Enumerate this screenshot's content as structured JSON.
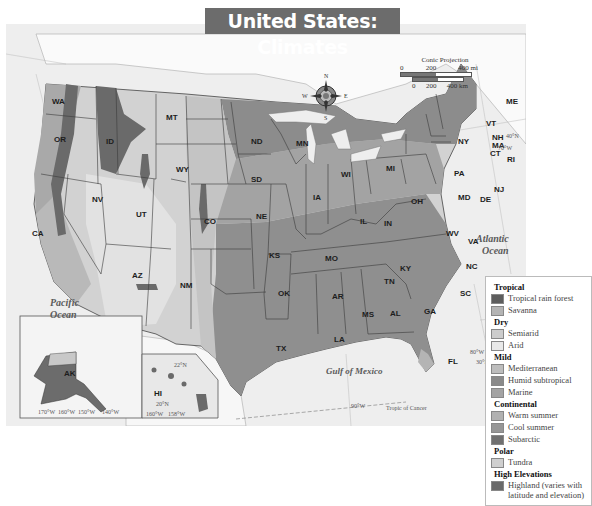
{
  "title": "United States: Climates",
  "projection": {
    "label": "Conic Projection",
    "scale_miles": [
      "0",
      "200",
      "400 mi"
    ],
    "scale_km": [
      "0",
      "200",
      "400 km"
    ]
  },
  "compass": {
    "n": "N",
    "s": "S",
    "e": "E",
    "w": "W"
  },
  "water_labels": {
    "pacific": [
      "Pacific",
      "Ocean"
    ],
    "atlantic": [
      "Atlantic",
      "Ocean"
    ],
    "gulf": "Gulf of Mexico",
    "tropic": "Tropic of Cancer"
  },
  "graticule": {
    "lat_40": "40°N",
    "lon_70": "70°W",
    "lon_80": "80°W",
    "lat_30": "30°N",
    "lon_90": "90°W",
    "ak": [
      "170°W",
      "160°W",
      "150°W",
      "140°W"
    ],
    "hi": [
      "160°W",
      "158°W"
    ],
    "hi_lat": [
      "22°N",
      "20°N"
    ]
  },
  "states": [
    "WA",
    "OR",
    "CA",
    "ID",
    "NV",
    "MT",
    "WY",
    "UT",
    "AZ",
    "CO",
    "NM",
    "ND",
    "SD",
    "NE",
    "KS",
    "OK",
    "TX",
    "MN",
    "IA",
    "MO",
    "AR",
    "LA",
    "WI",
    "IL",
    "MS",
    "MI",
    "IN",
    "KY",
    "TN",
    "AL",
    "OH",
    "WV",
    "GA",
    "FL",
    "SC",
    "NC",
    "VA",
    "PA",
    "NY",
    "MD",
    "DE",
    "NJ",
    "CT",
    "RI",
    "MA",
    "VT",
    "NH",
    "ME",
    "AK",
    "HI"
  ],
  "legend": {
    "groups": [
      {
        "heading": "Tropical",
        "items": [
          {
            "label": "Tropical rain forest",
            "color": "#5d5d5d"
          },
          {
            "label": "Savanna",
            "color": "#b4b4b4"
          }
        ]
      },
      {
        "heading": "Dry",
        "items": [
          {
            "label": "Semiarid",
            "color": "#cccccc"
          },
          {
            "label": "Arid",
            "color": "#e9e9e9"
          }
        ]
      },
      {
        "heading": "Mild",
        "items": [
          {
            "label": "Mediterranean",
            "color": "#bdbdbd"
          },
          {
            "label": "Humid subtropical",
            "color": "#8a8a8a"
          },
          {
            "label": "Marine",
            "color": "#a3a3a3"
          }
        ]
      },
      {
        "heading": "Continental",
        "items": [
          {
            "label": "Warm summer",
            "color": "#b1b1b1"
          },
          {
            "label": "Cool summer",
            "color": "#969696"
          },
          {
            "label": "Subarctic",
            "color": "#707070"
          }
        ]
      },
      {
        "heading": "Polar",
        "items": [
          {
            "label": "Tundra",
            "color": "#cfcfcf"
          }
        ]
      },
      {
        "heading": "High Elevations",
        "items": [
          {
            "label": "Highland (varies with latitude and elevation)",
            "color": "#6a6a6a"
          }
        ]
      }
    ]
  }
}
